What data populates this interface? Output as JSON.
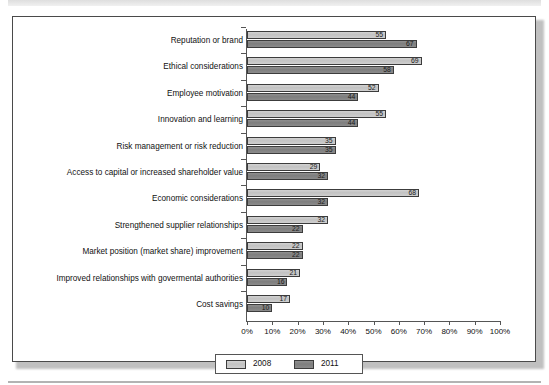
{
  "figure": {
    "background_color": "#ffffff",
    "border_color": "#4a4a4a"
  },
  "chart_data": {
    "type": "bar",
    "orientation": "horizontal",
    "title": "",
    "subtitle": "",
    "xlabel": "",
    "ylabel": "",
    "xlim": [
      0,
      100
    ],
    "grid": false,
    "legend_position": "bottom",
    "tick_labels": [
      "0%",
      "10%",
      "20%",
      "30%",
      "40%",
      "50%",
      "60%",
      "70%",
      "80%",
      "90%",
      "100%"
    ],
    "tick_values": [
      0,
      10,
      20,
      30,
      40,
      50,
      60,
      70,
      80,
      90,
      100
    ],
    "categories": [
      "Reputation or brand",
      "Ethical considerations",
      "Employee motivation",
      "Innovation and learning",
      "Risk management or risk reduction",
      "Access to capital or increased shareholder value",
      "Economic considerations",
      "Strengthened supplier relationships",
      "Market position (market share) improvement",
      "Improved relationships with govermental authorities",
      "Cost savings"
    ],
    "series": [
      {
        "name": "2008",
        "color": "#c9c9c9",
        "values": [
          55,
          69,
          52,
          55,
          35,
          29,
          68,
          32,
          22,
          21,
          17
        ]
      },
      {
        "name": "2011",
        "color": "#838383",
        "values": [
          67,
          58,
          44,
          44,
          35,
          32,
          32,
          22,
          22,
          16,
          10
        ]
      }
    ]
  },
  "legend": {
    "entries": [
      {
        "label": "2008"
      },
      {
        "label": "2011"
      }
    ]
  }
}
